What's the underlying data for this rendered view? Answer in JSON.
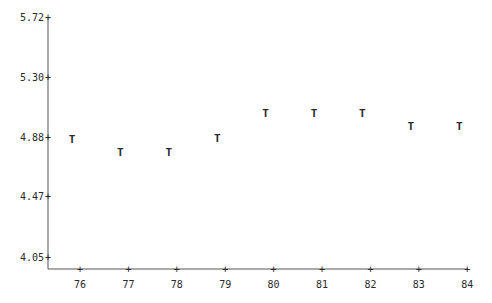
{
  "chart_data": {
    "type": "scatter",
    "title": "",
    "xlabel": "",
    "ylabel": "",
    "marker": "T",
    "x": [
      76,
      77,
      78,
      79,
      80,
      81,
      82,
      83,
      84
    ],
    "series": [
      {
        "name": "T",
        "values": [
          4.87,
          4.78,
          4.78,
          4.88,
          5.05,
          5.05,
          5.05,
          4.96,
          4.96
        ]
      }
    ],
    "x_ticks": [
      "76",
      "77",
      "78",
      "79",
      "80",
      "81",
      "82",
      "83",
      "84"
    ],
    "y_ticks": [
      "5.72",
      "5.30",
      "4.88",
      "4.47",
      "4.05"
    ],
    "ylim": [
      4.05,
      5.72
    ],
    "xlim": [
      75.5,
      84
    ],
    "grid": false,
    "legend": "none"
  },
  "colors": {
    "ink": "#2a2a2a",
    "axis": "#555555",
    "background": "#ffffff"
  }
}
